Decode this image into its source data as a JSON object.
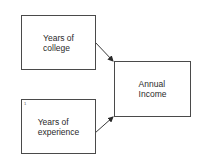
{
  "diagram": {
    "nodes": [
      {
        "id": "college",
        "label": "Years of\ncollege",
        "x": 21,
        "y": 15,
        "w": 75,
        "h": 55
      },
      {
        "id": "experience",
        "label": "Years of\nexperience",
        "x": 21,
        "y": 99,
        "w": 75,
        "h": 55,
        "mark": "1"
      },
      {
        "id": "income",
        "label": "Annual\nIncome",
        "x": 114,
        "y": 61,
        "w": 77,
        "h": 56
      }
    ],
    "edges": [
      {
        "from": "college",
        "to": "income"
      },
      {
        "from": "experience",
        "to": "income"
      }
    ],
    "colors": {
      "stroke": "#4a4a4a",
      "text": "#2a2a2a",
      "background": "#ffffff"
    }
  }
}
